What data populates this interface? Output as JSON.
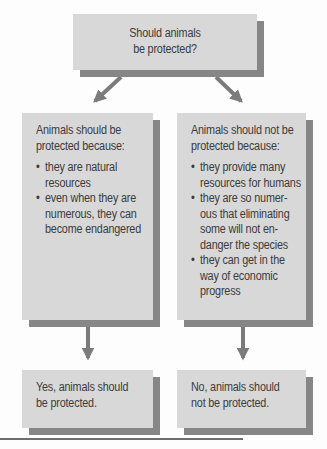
{
  "question": {
    "line1": "Should animals",
    "line2": "be protected?"
  },
  "left_branch": {
    "heading_line1": "Animals should be",
    "heading_line2": "protected because:",
    "bullets": [
      [
        "they are natural",
        "resources"
      ],
      [
        "even when they are",
        "numerous, they can",
        "become endangered"
      ]
    ],
    "conclusion_line1": "Yes, animals should",
    "conclusion_line2": "be protected."
  },
  "right_branch": {
    "heading_line1": "Animals should not be",
    "heading_line2": "protected because:",
    "bullets": [
      [
        "they provide many",
        "resources for humans"
      ],
      [
        "they are so numer-",
        "ous that eliminating",
        "some will not en-",
        "danger the species"
      ],
      [
        "they can get in the",
        "way of economic",
        "progress"
      ]
    ],
    "conclusion_line1": "No, animals should",
    "conclusion_line2": "not be protected."
  },
  "colors": {
    "box_fill": "#d8d8d8",
    "box_shadow": "#868686",
    "arrow": "#7b7b7b",
    "text": "#3b3b3b"
  }
}
